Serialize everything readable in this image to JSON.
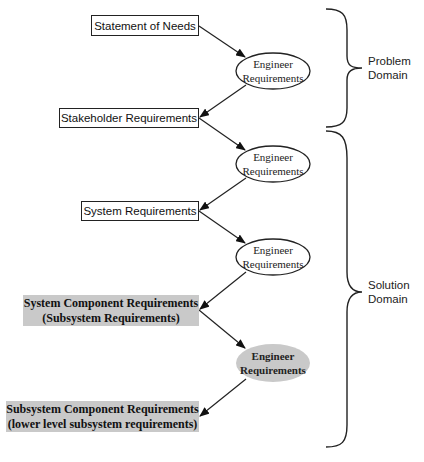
{
  "diagram": {
    "nodes": {
      "statement_of_needs": {
        "label": "Statement of Needs",
        "shape": "rect",
        "fill": "#ffffff"
      },
      "engineer_1": {
        "line1": "Engineer",
        "line2": "Requirements",
        "shape": "ellipse",
        "fill": "#ffffff"
      },
      "stakeholder_requirements": {
        "label": "Stakeholder Requirements",
        "shape": "rect",
        "fill": "#ffffff"
      },
      "engineer_2": {
        "line1": "Engineer",
        "line2": "Requirements",
        "shape": "ellipse",
        "fill": "#ffffff"
      },
      "system_requirements": {
        "label": "System Requirements",
        "shape": "rect",
        "fill": "#ffffff"
      },
      "engineer_3": {
        "line1": "Engineer",
        "line2": "Requirements",
        "shape": "ellipse",
        "fill": "#ffffff"
      },
      "system_component_requirements": {
        "line1": "System Component Requirements",
        "line2": "(Subsystem Requirements)",
        "shape": "rect",
        "fill": "#c9c9c9"
      },
      "engineer_4": {
        "line1": "Engineer",
        "line2": "Requirements",
        "shape": "ellipse",
        "fill": "#c9c9c9"
      },
      "subsystem_component_requirements": {
        "line1": "Subsystem Component Requirements",
        "line2": "(lower level subsystem requirements)",
        "shape": "rect",
        "fill": "#c9c9c9"
      }
    },
    "edges": [
      {
        "from": "statement_of_needs",
        "to": "engineer_1"
      },
      {
        "from": "engineer_1",
        "to": "stakeholder_requirements"
      },
      {
        "from": "stakeholder_requirements",
        "to": "engineer_2"
      },
      {
        "from": "engineer_2",
        "to": "system_requirements"
      },
      {
        "from": "system_requirements",
        "to": "engineer_3"
      },
      {
        "from": "engineer_3",
        "to": "system_component_requirements"
      },
      {
        "from": "system_component_requirements",
        "to": "engineer_4"
      },
      {
        "from": "engineer_4",
        "to": "subsystem_component_requirements"
      }
    ],
    "braces": {
      "problem": {
        "line1": "Problem",
        "line2": "Domain"
      },
      "solution": {
        "line1": "Solution",
        "line2": "Domain"
      }
    },
    "colors": {
      "stroke": "#222222",
      "gray_fill": "#c9c9c9"
    }
  }
}
